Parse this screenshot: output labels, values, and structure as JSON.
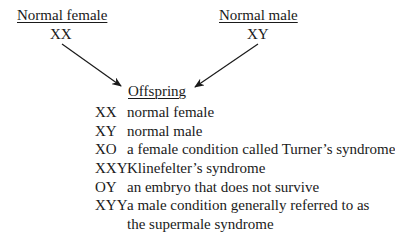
{
  "parents": {
    "female": {
      "label": "Normal female",
      "genotype": "XX"
    },
    "male": {
      "label": "Normal male",
      "genotype": "XY"
    }
  },
  "offspring": {
    "heading": "Offspring",
    "rows": [
      {
        "code": "XX",
        "desc": "normal female"
      },
      {
        "code": "XY",
        "desc": "normal male"
      },
      {
        "code": "XO",
        "desc": "a female condition called Turner’s syndrome"
      },
      {
        "code": "XXY",
        "desc": "Klinefelter’s syndrome"
      },
      {
        "code": "OY",
        "desc": "an embryo that does not survive"
      },
      {
        "code": "XYY",
        "desc": "a male condition generally referred to as",
        "desc2": "the supermale syndrome"
      }
    ]
  }
}
